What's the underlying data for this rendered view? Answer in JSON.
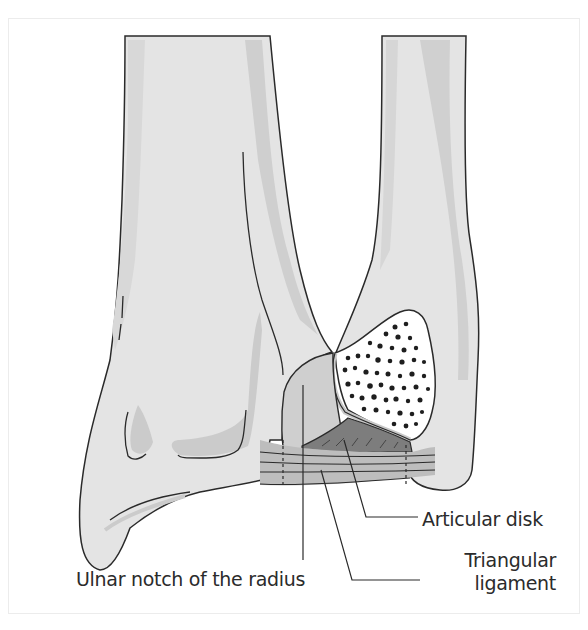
{
  "figure": {
    "labels": {
      "articular_disk": "Articular disk",
      "triangular_ligament_line1": "Triangular",
      "triangular_ligament_line2": "ligament",
      "ulnar_notch": "Ulnar notch of the radius"
    },
    "colors": {
      "bone_fill": "#e4e4e4",
      "bone_shade": "#cdcdcd",
      "outline": "#2a2a2a",
      "ligament": "#bdbdbd",
      "disk": "#7d7d7d",
      "cut_surface": "#ffffff",
      "frame": "#ececec"
    }
  }
}
